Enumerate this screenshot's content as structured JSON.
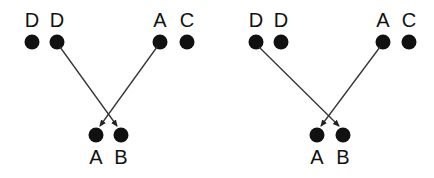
{
  "panels": [
    {
      "top_nodes": [
        {
          "label": "D",
          "x": 32,
          "y": 42
        },
        {
          "label": "D",
          "x": 57,
          "y": 42
        },
        {
          "label": "A",
          "x": 160,
          "y": 42
        },
        {
          "label": "C",
          "x": 187,
          "y": 42
        }
      ],
      "bottom_nodes": [
        {
          "label": "A",
          "x": 96,
          "y": 135
        },
        {
          "label": "B",
          "x": 121,
          "y": 135
        }
      ],
      "arrows": [
        {
          "from": "D (2nd)",
          "to": "B"
        },
        {
          "from": "A",
          "to": "A"
        }
      ]
    },
    {
      "top_nodes": [
        {
          "label": "D",
          "x": 256,
          "y": 42
        },
        {
          "label": "D",
          "x": 281,
          "y": 42
        },
        {
          "label": "A",
          "x": 383,
          "y": 42
        },
        {
          "label": "C",
          "x": 409,
          "y": 42
        }
      ],
      "bottom_nodes": [
        {
          "label": "A",
          "x": 317,
          "y": 135
        },
        {
          "label": "B",
          "x": 343,
          "y": 135
        }
      ],
      "arrows": [
        {
          "from": "D (1st)",
          "to": "B"
        },
        {
          "from": "A",
          "to": "A"
        }
      ]
    }
  ],
  "colors": {
    "node": "#111111",
    "line": "#333333"
  }
}
